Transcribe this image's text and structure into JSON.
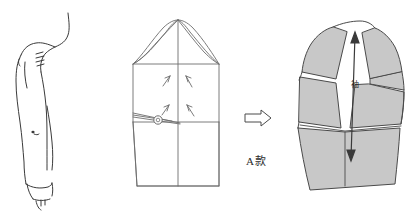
{
  "figure": {
    "title": "",
    "background_color": "#ffffff",
    "stroke_color": "#3a3a3a",
    "fill_gray": "#c8c8c8",
    "panels": [
      {
        "id": "arm-sketch",
        "name": "human arm and shoulder sketch",
        "position": "left",
        "filled": false
      },
      {
        "id": "sleeve-pattern-base",
        "name": "base sleeve pattern block with slash marks",
        "position": "center",
        "filled": false,
        "markers": [
          "slash-arrow-pair-upper",
          "slash-arrow-pair-lower",
          "pivot-circle"
        ]
      },
      {
        "id": "sleeve-pattern-spread",
        "name": "slashed and spread sleeve pattern",
        "position": "right",
        "filled": true
      }
    ]
  },
  "labels": {
    "style_code": "A款",
    "piece_name": "袖"
  },
  "arrow": {
    "name": "transform-arrow",
    "direction": "right",
    "glyph": "⇨"
  },
  "grainline": {
    "name": "grainline-arrow",
    "direction": "vertical-double"
  }
}
